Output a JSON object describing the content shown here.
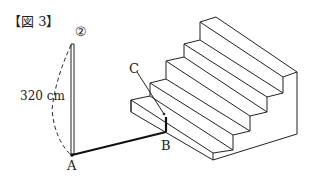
{
  "figure": {
    "title": "【図 3】",
    "pole_label": "②",
    "height_label": "320 cm",
    "points": {
      "A": "A",
      "B": "B",
      "C": "C"
    }
  },
  "colors": {
    "line": "#222222",
    "background": "#ffffff"
  }
}
